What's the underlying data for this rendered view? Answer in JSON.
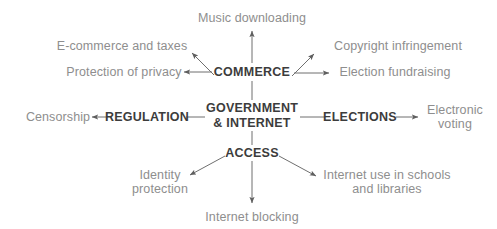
{
  "diagram": {
    "type": "radial-concept-map",
    "colors": {
      "background": "#ffffff",
      "leaf_text": "#8e8e8e",
      "hub_text": "#3c3c3c",
      "connector": "#6f6f6f"
    },
    "center": {
      "id": "center",
      "line1": "GOVERNMENT",
      "line2": "& INTERNET",
      "x": 252,
      "y": 115
    },
    "hubs": [
      {
        "id": "commerce",
        "label": "COMMERCE",
        "x": 252,
        "y": 72
      },
      {
        "id": "regulation",
        "label": "REGULATION",
        "x": 147,
        "y": 117
      },
      {
        "id": "elections",
        "label": "ELECTIONS",
        "x": 360,
        "y": 117
      },
      {
        "id": "access",
        "label": "ACCESS",
        "x": 252,
        "y": 153
      }
    ],
    "leaves": [
      {
        "id": "music-downloading",
        "hub": "commerce",
        "line1": "Music downloading",
        "line2": "",
        "x": 252,
        "y": 18
      },
      {
        "id": "ecommerce-and-taxes",
        "hub": "commerce",
        "line1": "E-commerce and taxes",
        "line2": "",
        "x": 122,
        "y": 46
      },
      {
        "id": "protection-of-privacy",
        "hub": "commerce",
        "line1": "Protection of privacy",
        "line2": "",
        "x": 124,
        "y": 72
      },
      {
        "id": "copyright-infringement",
        "hub": "commerce",
        "line1": "Copyright infringement",
        "line2": "",
        "x": 398,
        "y": 46
      },
      {
        "id": "election-fundraising",
        "hub": "commerce",
        "line1": "Election fundraising",
        "line2": "",
        "x": 395,
        "y": 72
      },
      {
        "id": "censorship",
        "hub": "regulation",
        "line1": "Censorship",
        "line2": "",
        "x": 58,
        "y": 117
      },
      {
        "id": "electronic-voting",
        "hub": "elections",
        "line1": "Electronic",
        "line2": "voting",
        "x": 455,
        "y": 117
      },
      {
        "id": "identity-protection",
        "hub": "access",
        "line1": "Identity",
        "line2": "protection",
        "x": 160,
        "y": 182
      },
      {
        "id": "internet-use-schools",
        "hub": "access",
        "line1": "Internet use in schools",
        "line2": "and libraries",
        "x": 387,
        "y": 182
      },
      {
        "id": "internet-blocking",
        "hub": "access",
        "line1": "Internet blocking",
        "line2": "",
        "x": 252,
        "y": 217
      }
    ],
    "connectors": [
      {
        "id": "center-to-commerce",
        "from": "center",
        "to": "commerce",
        "arrow": "none"
      },
      {
        "id": "center-to-regulation",
        "from": "center",
        "to": "regulation",
        "arrow": "none"
      },
      {
        "id": "center-to-elections",
        "from": "center",
        "to": "elections",
        "arrow": "none"
      },
      {
        "id": "center-to-access",
        "from": "center",
        "to": "access",
        "arrow": "none"
      },
      {
        "id": "commerce-to-music",
        "from": "commerce",
        "to": "music-downloading",
        "arrow": "end"
      },
      {
        "id": "commerce-to-ecommerce",
        "from": "commerce",
        "to": "ecommerce-and-taxes",
        "arrow": "end"
      },
      {
        "id": "commerce-to-privacy",
        "from": "commerce",
        "to": "protection-of-privacy",
        "arrow": "end"
      },
      {
        "id": "commerce-to-copyright",
        "from": "commerce",
        "to": "copyright-infringement",
        "arrow": "end"
      },
      {
        "id": "commerce-to-fundraising",
        "from": "commerce",
        "to": "election-fundraising",
        "arrow": "end"
      },
      {
        "id": "regulation-to-censorship",
        "from": "regulation",
        "to": "censorship",
        "arrow": "end"
      },
      {
        "id": "elections-to-evoting",
        "from": "elections",
        "to": "electronic-voting",
        "arrow": "end"
      },
      {
        "id": "access-to-identity",
        "from": "access",
        "to": "identity-protection",
        "arrow": "end"
      },
      {
        "id": "access-to-schools",
        "from": "access",
        "to": "internet-use-schools",
        "arrow": "end"
      },
      {
        "id": "access-to-blocking",
        "from": "access",
        "to": "internet-blocking",
        "arrow": "end"
      }
    ]
  }
}
